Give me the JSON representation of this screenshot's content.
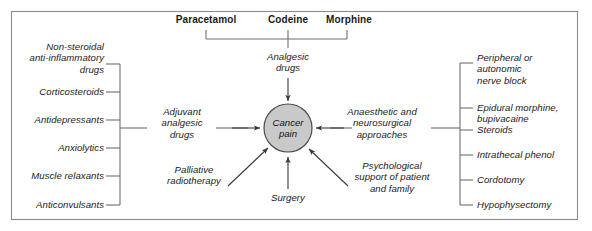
{
  "figure": {
    "frame_color": "#8c8c8c",
    "line_color": "#6e6e6e",
    "arrow_color": "#3a3a3a",
    "text_color": "#1a1a1a",
    "background": "#ffffff"
  },
  "center": {
    "label": "Cancer\npain",
    "fill_color": "#c9c9c9",
    "stroke_color": "#4d4d4d"
  },
  "top_drugs": {
    "items": [
      {
        "label": "Paracetamol"
      },
      {
        "label": "Codeine"
      },
      {
        "label": "Morphine"
      }
    ],
    "group_label": "Analgesic\ndrugs"
  },
  "left_branch": {
    "group_label": "Adjuvant\nanalgesic\ndrugs",
    "items": [
      {
        "label": "Non-steroidal\nanti-inflammatory\ndrugs"
      },
      {
        "label": "Corticosteroids"
      },
      {
        "label": "Antidepressants"
      },
      {
        "label": "Anxiolytics"
      },
      {
        "label": "Muscle relaxants"
      },
      {
        "label": "Anticonvulsants"
      }
    ]
  },
  "right_branch": {
    "group_label": "Anaesthetic and\nneurosurgical\napproaches",
    "items": [
      {
        "label": "Peripheral or\nautonomic\nnerve block"
      },
      {
        "label": "Epidural morphine,\nbupivacaine"
      },
      {
        "label": "Steroids"
      },
      {
        "label": "Intrathecal phenol"
      },
      {
        "label": "Cordotomy"
      },
      {
        "label": "Hypophysectomy"
      }
    ]
  },
  "other_branches": [
    {
      "label": "Palliative\nradiotherapy"
    },
    {
      "label": "Surgery"
    },
    {
      "label": "Psychological\nsupport of patient\nand family"
    }
  ]
}
